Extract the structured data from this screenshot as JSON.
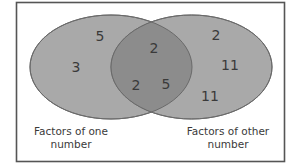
{
  "diagram": {
    "type": "venn",
    "colors": {
      "set_fill": "#a9a9a9",
      "overlap_fill": "#8c8c8c",
      "stroke": "#6a6a6a",
      "border": "#555555",
      "text": "#3a3a3a"
    },
    "left_set": {
      "label_line1": "Factors of one",
      "label_line2": "number",
      "only_values": [
        "5",
        "3"
      ]
    },
    "right_set": {
      "label_line1": "Factors of other",
      "label_line2": "number",
      "only_values": [
        "2",
        "11",
        "11"
      ]
    },
    "intersection": {
      "values": [
        "2",
        "2",
        "5"
      ]
    }
  }
}
